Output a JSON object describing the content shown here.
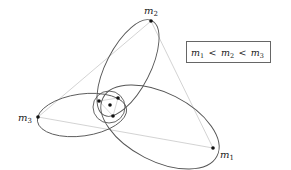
{
  "diagram": {
    "legend": {
      "text_parts": [
        {
          "base": "m",
          "sub": "1"
        },
        {
          "op": "<"
        },
        {
          "base": "m",
          "sub": "2"
        },
        {
          "op": "<"
        },
        {
          "base": "m",
          "sub": "3"
        }
      ],
      "text": "m1 < m2 < m3"
    },
    "bodies": [
      {
        "id": "m1",
        "base": "m",
        "sub": "1",
        "x": 213,
        "y": 148,
        "label_x": 220,
        "label_y": 158
      },
      {
        "id": "m2",
        "base": "m",
        "sub": "2",
        "x": 151,
        "y": 21,
        "label_x": 144,
        "label_y": 14
      },
      {
        "id": "m3",
        "base": "m",
        "sub": "3",
        "x": 38,
        "y": 117,
        "label_x": 18,
        "label_y": 121
      }
    ],
    "inner_points": [
      {
        "x": 99,
        "y": 101
      },
      {
        "x": 118,
        "y": 98
      },
      {
        "x": 113,
        "y": 116
      }
    ],
    "center_of_mass": {
      "x": 110,
      "y": 105
    },
    "colors": {
      "orbit": "#555555",
      "triangle": "#c8c8c8",
      "point": "#111111",
      "box_border": "#666666"
    }
  }
}
